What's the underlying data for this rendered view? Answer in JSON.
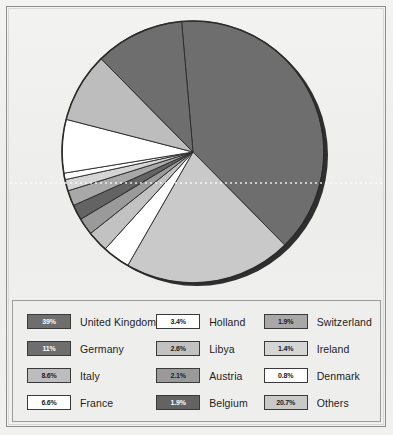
{
  "chart_data": {
    "type": "pie",
    "title": "",
    "subtitle": "",
    "xlabel": "",
    "ylabel": "",
    "legend_position": "bottom",
    "grid": false,
    "unit": "%",
    "categories": [
      "United Kingdom",
      "Others",
      "Holland",
      "Libya",
      "Austria",
      "Belgium",
      "Switzerland",
      "Ireland",
      "Denmark",
      "France",
      "Italy",
      "Germany"
    ],
    "values": [
      39,
      20.7,
      3.4,
      2.6,
      2.1,
      1.9,
      1.9,
      1.4,
      0.8,
      6.6,
      8.6,
      11
    ],
    "slices": [
      {
        "label": "United Kingdom",
        "value": 39,
        "display": "39%",
        "color": "#6e6e6e",
        "text_color": "#ffffff"
      },
      {
        "label": "Others",
        "value": 20.7,
        "display": "20.7%",
        "color": "#c9c9c9",
        "text_color": "#1a1a1a"
      },
      {
        "label": "Holland",
        "value": 3.4,
        "display": "3.4%",
        "color": "#ffffff",
        "text_color": "#1a1a1a"
      },
      {
        "label": "Libya",
        "value": 2.6,
        "display": "2.6%",
        "color": "#c2c2c2",
        "text_color": "#1a1a1a"
      },
      {
        "label": "Austria",
        "value": 2.1,
        "display": "2.1%",
        "color": "#9a9a9a",
        "text_color": "#1a1a1a"
      },
      {
        "label": "Belgium",
        "value": 1.9,
        "display": "1.9%",
        "color": "#636363",
        "text_color": "#ffffff"
      },
      {
        "label": "Switzerland",
        "value": 1.9,
        "display": "1.9%",
        "color": "#a8a8a8",
        "text_color": "#1a1a1a"
      },
      {
        "label": "Ireland",
        "value": 1.4,
        "display": "1.4%",
        "color": "#d5d5d5",
        "text_color": "#1a1a1a"
      },
      {
        "label": "Denmark",
        "value": 0.8,
        "display": "0.8%",
        "color": "#ffffff",
        "text_color": "#1a1a1a"
      },
      {
        "label": "France",
        "value": 6.6,
        "display": "6.6%",
        "color": "#ffffff",
        "text_color": "#1a1a1a"
      },
      {
        "label": "Italy",
        "value": 8.6,
        "display": "8.6%",
        "color": "#bdbdbd",
        "text_color": "#1a1a1a"
      },
      {
        "label": "Germany",
        "value": 11,
        "display": "11%",
        "color": "#6e6e6e",
        "text_color": "#ffffff"
      }
    ]
  },
  "legend": {
    "columns": [
      [
        {
          "display": "39%",
          "label": "United Kingdom",
          "color": "#6e6e6e",
          "tone": "dark"
        },
        {
          "display": "11%",
          "label": "Germany",
          "color": "#6e6e6e",
          "tone": "dark"
        },
        {
          "display": "8.6%",
          "label": "Italy",
          "color": "#bdbdbd",
          "tone": "light"
        },
        {
          "display": "6.6%",
          "label": "France",
          "color": "#ffffff",
          "tone": "light"
        }
      ],
      [
        {
          "display": "3.4%",
          "label": "Holland",
          "color": "#ffffff",
          "tone": "light"
        },
        {
          "display": "2.6%",
          "label": "Libya",
          "color": "#c2c2c2",
          "tone": "light"
        },
        {
          "display": "2.1%",
          "label": "Austria",
          "color": "#9a9a9a",
          "tone": "light"
        },
        {
          "display": "1.9%",
          "label": "Belgium",
          "color": "#636363",
          "tone": "dark"
        }
      ],
      [
        {
          "display": "1.9%",
          "label": "Switzerland",
          "color": "#a8a8a8",
          "tone": "light"
        },
        {
          "display": "1.4%",
          "label": "Ireland",
          "color": "#d5d5d5",
          "tone": "light"
        },
        {
          "display": "0.8%",
          "label": "Denmark",
          "color": "#ffffff",
          "tone": "light"
        },
        {
          "display": "20.7%",
          "label": "Others",
          "color": "#c9c9c9",
          "tone": "light"
        }
      ]
    ]
  },
  "style": {
    "page_background": "#efefed",
    "frame_border": "#8e8e8e",
    "pie_outline": "#2b2b2b",
    "pie_shadow": "#2f2f2f"
  }
}
